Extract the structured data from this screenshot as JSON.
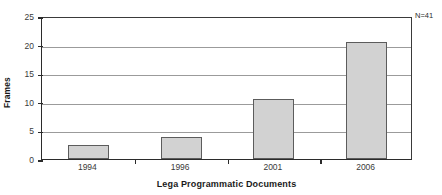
{
  "chart_data": {
    "type": "bar",
    "title": "",
    "xlabel": "Lega Programmatic Documents",
    "ylabel": "Frames",
    "categories": [
      "1994",
      "1996",
      "2001",
      "2006"
    ],
    "values": [
      2.4,
      3.8,
      10.5,
      20.4
    ],
    "ylim": [
      0,
      25
    ],
    "yticks": [
      0,
      5,
      10,
      15,
      20,
      25
    ],
    "ytick_labels": [
      "0",
      "5",
      "10",
      "15",
      "20",
      "25"
    ],
    "grid": "horizontal",
    "legend": "none",
    "annotations": [
      {
        "name": "sample-size",
        "text": "N=41",
        "position": "top-right-outside"
      }
    ],
    "colors": {
      "bar_fill": "#d2d2d2",
      "bar_border": "#5c5c5c",
      "axis": "#2b2b2b",
      "gridline": "#9b9b9b",
      "text": "#1a1a1a",
      "background": "#ffffff"
    }
  }
}
